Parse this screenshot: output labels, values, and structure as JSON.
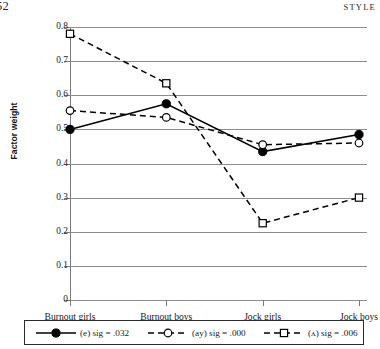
{
  "running_head": {
    "page_number": "52",
    "title": "STYLE"
  },
  "chart_data": {
    "type": "line",
    "title": "",
    "xlabel": "",
    "ylabel": "Factor weight",
    "categories": [
      "Burnout girls",
      "Burnout boys",
      "Jock girls",
      "Jock boys"
    ],
    "ylim": [
      0,
      0.8
    ],
    "ytick_labels": [
      "0",
      "0.1",
      "0.2",
      "0.3",
      "0.4",
      "0.5",
      "0.6",
      "0.7",
      "0.8"
    ],
    "ytick_values": [
      0,
      0.1,
      0.2,
      0.3,
      0.4,
      0.5,
      0.6,
      0.7,
      0.8
    ],
    "grid": "horizontal",
    "legend_position": "bottom",
    "series": [
      {
        "name": "(e) sig = .032",
        "values": [
          0.5,
          0.575,
          0.435,
          0.485
        ],
        "line_style": "solid",
        "marker": "filled-circle",
        "color": "#000000"
      },
      {
        "name": "(ay) sig = .000",
        "values": [
          0.555,
          0.535,
          0.455,
          0.46
        ],
        "line_style": "dashed",
        "marker": "open-circle",
        "color": "#000000"
      },
      {
        "name": "(ʌ) sig = .006",
        "values": [
          0.78,
          0.635,
          0.225,
          0.3
        ],
        "line_style": "dashed",
        "marker": "open-square",
        "color": "#000000"
      }
    ]
  },
  "legend": {
    "items": [
      {
        "label": "(e) sig = .032"
      },
      {
        "label": "(ay) sig = .000"
      },
      {
        "label": "(ʌ) sig = .006"
      }
    ]
  }
}
